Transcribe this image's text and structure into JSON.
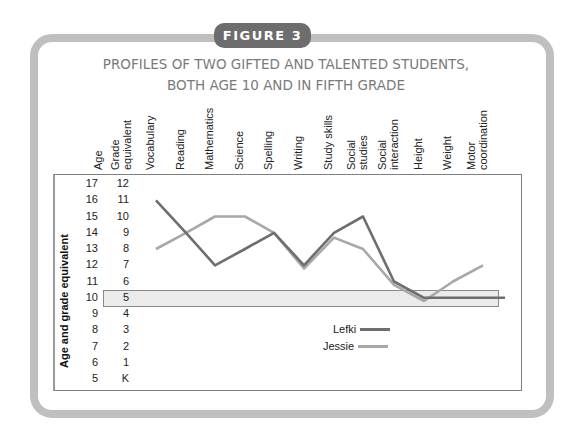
{
  "figure": {
    "tab_label": "FIGURE 3",
    "title_line1": "PROFILES OF TWO GIFTED AND TALENTED STUDENTS,",
    "title_line2": "BOTH AGE 10 AND IN FIFTH GRADE"
  },
  "axes": {
    "ylabel": "Age and grade equivalent",
    "age_header": "Age",
    "grade_header_line1": "Grade",
    "grade_header_line2": "equivalent",
    "age_ticks": [
      "17",
      "16",
      "15",
      "14",
      "13",
      "12",
      "11",
      "10",
      "9",
      "8",
      "7",
      "6",
      "5"
    ],
    "grade_ticks": [
      "12",
      "11",
      "10",
      "9",
      "8",
      "7",
      "6",
      "5",
      "4",
      "3",
      "2",
      "1",
      "K"
    ],
    "highlight_age": "10"
  },
  "columns": [
    {
      "line1": "Vocabulary",
      "line2": ""
    },
    {
      "line1": "Reading",
      "line2": ""
    },
    {
      "line1": "Mathematics",
      "line2": ""
    },
    {
      "line1": "Science",
      "line2": ""
    },
    {
      "line1": "Spelling",
      "line2": ""
    },
    {
      "line1": "Writing",
      "line2": ""
    },
    {
      "line1": "Study skills",
      "line2": ""
    },
    {
      "line1": "Social",
      "line2": "studies"
    },
    {
      "line1": "Social",
      "line2": "interaction"
    },
    {
      "line1": "Height",
      "line2": ""
    },
    {
      "line1": "Weight",
      "line2": ""
    },
    {
      "line1": "Motor",
      "line2": "coordination"
    }
  ],
  "legend": [
    {
      "name": "Lefki",
      "color": "#6e6e6e"
    },
    {
      "name": "Jessie",
      "color": "#a8a8a8"
    }
  ],
  "chart_data": {
    "type": "line",
    "subtitle": "FIGURE 3",
    "categories": [
      "Vocabulary",
      "Reading",
      "Mathematics",
      "Science",
      "Spelling",
      "Writing",
      "Study skills",
      "Social studies",
      "Social interaction",
      "Height",
      "Weight",
      "Motor coordination"
    ],
    "series": [
      {
        "name": "Lefki",
        "color": "#6e6e6e",
        "values": [
          16,
          14,
          12,
          13,
          14,
          12,
          14,
          15,
          11,
          10,
          10,
          10
        ]
      },
      {
        "name": "Jessie",
        "color": "#a8a8a8",
        "values": [
          13,
          14,
          15,
          15,
          14,
          11.8,
          13.7,
          13,
          10.8,
          9.8,
          11,
          12
        ]
      }
    ],
    "xlabel": "",
    "ylabel": "Age and grade equivalent",
    "ylim": [
      5,
      17
    ],
    "y_tick_labels_age": [
      "5",
      "6",
      "7",
      "8",
      "9",
      "10",
      "11",
      "12",
      "13",
      "14",
      "15",
      "16",
      "17"
    ],
    "y_tick_labels_grade": [
      "K",
      "1",
      "2",
      "3",
      "4",
      "5",
      "6",
      "7",
      "8",
      "9",
      "10",
      "11",
      "12"
    ],
    "annotations": [
      "Highlighted band at age 10 / grade 5"
    ],
    "grid": false,
    "legend_position": "lower center inside plot"
  }
}
